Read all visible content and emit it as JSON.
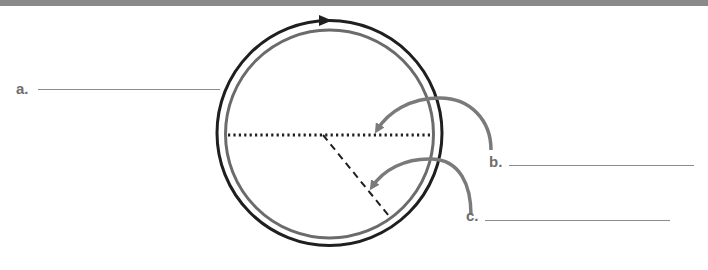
{
  "diagram": {
    "colors": {
      "header_bar": "#8a8a8a",
      "outer_circle": "#1f1f1f",
      "inner_circle": "#6b6b6b",
      "arrows": "#7a7a7a",
      "dotted_line": "#1f1f1f",
      "dashed_line": "#1f1f1f",
      "label_text": "#6e6e6e"
    },
    "circle": {
      "cx": 329.5,
      "cy": 133,
      "outer_r": 113,
      "inner_r": 104
    },
    "labels": [
      {
        "id": "a",
        "text": "a.",
        "points_to": "outer circle (circumference)"
      },
      {
        "id": "b",
        "text": "b.",
        "points_to": "dotted horizontal line (diameter)"
      },
      {
        "id": "c",
        "text": "c.",
        "points_to": "dashed line (radius)"
      }
    ]
  }
}
